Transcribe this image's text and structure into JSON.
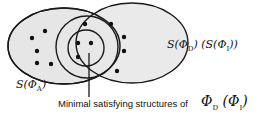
{
  "labels": {
    "set_d_i": "S(ΦD) (S(ΦI))",
    "set_d_i_parts": {
      "s1": "S(Φ",
      "sub1": "D",
      "mid": ") (S(Φ",
      "sub2": "I",
      "end": "))"
    },
    "set_a_parts": {
      "s": "S(Φ",
      "sub": "A",
      "end": ")"
    },
    "caption": "Minimal satisfying structures of",
    "caption_math_parts": {
      "phi1": "Φ",
      "sub1": "D",
      "open": " (Φ",
      "sub2": "I",
      "close": ")"
    }
  },
  "colors": {
    "fill": "#e6e6e6",
    "stroke": "#1a1a1a",
    "dot": "#111111"
  },
  "dots": [
    [
      32,
      38
    ],
    [
      45,
      31
    ],
    [
      37,
      51
    ],
    [
      37,
      63
    ],
    [
      51,
      64
    ],
    [
      84,
      23
    ],
    [
      111,
      23
    ],
    [
      78,
      43
    ],
    [
      91,
      43
    ],
    [
      78,
      56
    ],
    [
      123,
      38
    ],
    [
      123,
      51
    ],
    [
      117,
      70
    ]
  ]
}
